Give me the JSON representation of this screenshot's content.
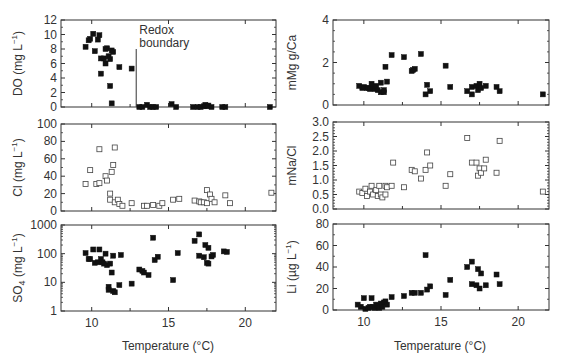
{
  "figure": {
    "x_axis_label": "Temperature (°C)",
    "x_ticks": [
      10,
      15,
      20
    ],
    "annotation": {
      "text_line1": "Redox",
      "text_line2": "boundary",
      "x": 12.9
    }
  },
  "chart_data": [
    {
      "id": "do",
      "type": "scatter",
      "title": "",
      "xlabel": "",
      "ylabel": "DO (mg L⁻¹)",
      "ylabel_main": "DO (mg L",
      "ylabel_sup": "−1",
      "ylabel_end": ")",
      "scale": "linear",
      "xlim": [
        8,
        22
      ],
      "ylim": [
        0,
        12
      ],
      "yticks": [
        0,
        2,
        4,
        6,
        8,
        10,
        12
      ],
      "marker": "filled-square",
      "annotations": [
        {
          "text": "Redox boundary",
          "x": 12.9,
          "type": "vertical-line",
          "y_top": 8
        }
      ],
      "points": [
        [
          9.6,
          8.3
        ],
        [
          9.8,
          9.2
        ],
        [
          9.9,
          9.4
        ],
        [
          10.1,
          10.1
        ],
        [
          10.2,
          7.7
        ],
        [
          10.4,
          9.3
        ],
        [
          10.5,
          9.9
        ],
        [
          10.6,
          6.7
        ],
        [
          10.6,
          4.6
        ],
        [
          10.8,
          6.7
        ],
        [
          10.9,
          6.0
        ],
        [
          10.9,
          8.0
        ],
        [
          11.0,
          8.1
        ],
        [
          11.1,
          7.0
        ],
        [
          11.2,
          6.6
        ],
        [
          11.2,
          2.9
        ],
        [
          11.3,
          7.8
        ],
        [
          11.4,
          7.6
        ],
        [
          11.3,
          0.5
        ],
        [
          11.8,
          5.5
        ],
        [
          12.6,
          5.3
        ],
        [
          13.1,
          0.0
        ],
        [
          13.3,
          0.0
        ],
        [
          13.6,
          0.3
        ],
        [
          13.8,
          0.0
        ],
        [
          14.0,
          0.0
        ],
        [
          14.2,
          0.0
        ],
        [
          15.2,
          0.4
        ],
        [
          15.5,
          0.0
        ],
        [
          16.6,
          0.0
        ],
        [
          16.9,
          0.0
        ],
        [
          17.1,
          0.0
        ],
        [
          17.3,
          0.1
        ],
        [
          17.4,
          0.3
        ],
        [
          17.5,
          0.1
        ],
        [
          17.6,
          0.2
        ],
        [
          17.8,
          0.0
        ],
        [
          18.5,
          0.0
        ],
        [
          18.7,
          0.0
        ],
        [
          21.6,
          0.0
        ]
      ]
    },
    {
      "id": "cl",
      "type": "scatter",
      "ylabel": "Cl (mg L⁻¹)",
      "ylabel_main": "Cl (mg L",
      "ylabel_sup": "−1",
      "ylabel_end": ")",
      "scale": "linear",
      "xlim": [
        8,
        22
      ],
      "ylim": [
        0,
        100
      ],
      "yticks": [
        0,
        20,
        40,
        60,
        80,
        100
      ],
      "marker": "open-square",
      "points": [
        [
          9.6,
          31
        ],
        [
          9.9,
          47
        ],
        [
          10.3,
          31
        ],
        [
          10.5,
          32
        ],
        [
          10.5,
          71
        ],
        [
          10.9,
          40
        ],
        [
          11.0,
          35
        ],
        [
          11.2,
          20
        ],
        [
          11.2,
          13
        ],
        [
          11.3,
          45
        ],
        [
          11.4,
          53
        ],
        [
          11.5,
          73
        ],
        [
          11.5,
          10
        ],
        [
          11.7,
          13
        ],
        [
          11.8,
          8
        ],
        [
          12.0,
          6
        ],
        [
          12.6,
          9
        ],
        [
          13.4,
          6
        ],
        [
          13.6,
          6
        ],
        [
          14.0,
          7
        ],
        [
          14.4,
          6
        ],
        [
          14.6,
          9
        ],
        [
          15.3,
          13
        ],
        [
          15.7,
          14
        ],
        [
          16.7,
          12
        ],
        [
          17.0,
          11
        ],
        [
          17.1,
          10
        ],
        [
          17.3,
          10
        ],
        [
          17.5,
          24
        ],
        [
          17.5,
          9
        ],
        [
          17.7,
          19
        ],
        [
          17.8,
          14
        ],
        [
          18.0,
          10
        ],
        [
          18.7,
          18
        ],
        [
          19.0,
          9
        ],
        [
          21.7,
          21
        ]
      ]
    },
    {
      "id": "so4",
      "type": "scatter",
      "ylabel": "SO₄ (mg L⁻¹)",
      "ylabel_main": "SO",
      "ylabel_sub": "4",
      "ylabel_mid": " (mg L",
      "ylabel_sup": "−1",
      "ylabel_end": ")",
      "scale": "log",
      "xlim": [
        8,
        22
      ],
      "ylim": [
        1,
        1000
      ],
      "yticks": [
        1,
        10,
        100,
        1000
      ],
      "marker": "filled-square",
      "points": [
        [
          9.6,
          105
        ],
        [
          9.8,
          65
        ],
        [
          9.9,
          65
        ],
        [
          10.1,
          140
        ],
        [
          10.2,
          48
        ],
        [
          10.4,
          50
        ],
        [
          10.5,
          140
        ],
        [
          10.6,
          65
        ],
        [
          10.7,
          50
        ],
        [
          10.8,
          45
        ],
        [
          10.9,
          100
        ],
        [
          11.0,
          40
        ],
        [
          11.2,
          45
        ],
        [
          11.3,
          22
        ],
        [
          11.1,
          7
        ],
        [
          11.1,
          5.5
        ],
        [
          11.4,
          5
        ],
        [
          11.5,
          4.5
        ],
        [
          11.4,
          85
        ],
        [
          11.8,
          8
        ],
        [
          11.9,
          90
        ],
        [
          12.6,
          9
        ],
        [
          13.1,
          28
        ],
        [
          13.3,
          25
        ],
        [
          13.4,
          22
        ],
        [
          13.7,
          18
        ],
        [
          14.0,
          360
        ],
        [
          14.1,
          60
        ],
        [
          14.3,
          78
        ],
        [
          15.3,
          12
        ],
        [
          15.6,
          105
        ],
        [
          16.7,
          280
        ],
        [
          17.0,
          470
        ],
        [
          17.0,
          85
        ],
        [
          17.3,
          75
        ],
        [
          17.4,
          200
        ],
        [
          17.5,
          48
        ],
        [
          17.6,
          45
        ],
        [
          17.6,
          160
        ],
        [
          17.8,
          80
        ],
        [
          17.9,
          90
        ],
        [
          18.6,
          120
        ],
        [
          18.8,
          115
        ]
      ]
    },
    {
      "id": "mgca",
      "type": "scatter",
      "ylabel": "mMg g/Ca",
      "scale": "linear",
      "xlim": [
        8,
        22
      ],
      "ylim": [
        0,
        4
      ],
      "yticks": [
        0,
        2,
        4
      ],
      "marker": "filled-square",
      "points": [
        [
          9.7,
          0.9
        ],
        [
          9.9,
          0.8
        ],
        [
          10.0,
          0.85
        ],
        [
          10.2,
          0.8
        ],
        [
          10.3,
          0.8
        ],
        [
          10.4,
          0.75
        ],
        [
          10.5,
          1.0
        ],
        [
          10.6,
          0.8
        ],
        [
          10.7,
          0.75
        ],
        [
          10.8,
          0.9
        ],
        [
          10.9,
          0.7
        ],
        [
          11.1,
          1.05
        ],
        [
          11.1,
          0.6
        ],
        [
          11.3,
          0.7
        ],
        [
          11.3,
          0.6
        ],
        [
          11.4,
          1.8
        ],
        [
          11.5,
          1.1
        ],
        [
          11.8,
          2.35
        ],
        [
          12.6,
          2.25
        ],
        [
          13.1,
          1.6
        ],
        [
          13.2,
          1.65
        ],
        [
          13.3,
          1.7
        ],
        [
          13.7,
          2.4
        ],
        [
          14.0,
          0.5
        ],
        [
          14.1,
          0.95
        ],
        [
          14.3,
          0.65
        ],
        [
          15.3,
          1.85
        ],
        [
          15.6,
          0.85
        ],
        [
          16.7,
          0.65
        ],
        [
          17.0,
          0.85
        ],
        [
          17.0,
          0.5
        ],
        [
          17.3,
          0.9
        ],
        [
          17.4,
          0.7
        ],
        [
          17.5,
          1.0
        ],
        [
          17.6,
          0.8
        ],
        [
          17.9,
          0.9
        ],
        [
          18.6,
          0.85
        ],
        [
          18.8,
          0.65
        ],
        [
          21.6,
          0.5
        ]
      ]
    },
    {
      "id": "nacl",
      "type": "scatter",
      "ylabel": "mNa/Cl",
      "scale": "linear",
      "xlim": [
        8,
        22
      ],
      "ylim": [
        0,
        3
      ],
      "yticks": [
        0.0,
        0.5,
        1.0,
        1.5,
        2.0,
        2.5,
        3.0
      ],
      "ytick_labels": [
        "0.0",
        "0.5",
        "1.0",
        "1.5",
        "2.0",
        "2.5",
        "3.0"
      ],
      "marker": "open-square",
      "points": [
        [
          9.7,
          0.6
        ],
        [
          9.9,
          0.55
        ],
        [
          10.1,
          0.7
        ],
        [
          10.2,
          0.45
        ],
        [
          10.4,
          0.6
        ],
        [
          10.5,
          0.8
        ],
        [
          10.6,
          0.5
        ],
        [
          10.8,
          0.65
        ],
        [
          10.9,
          0.45
        ],
        [
          11.0,
          0.8
        ],
        [
          11.1,
          0.5
        ],
        [
          11.2,
          0.4
        ],
        [
          11.4,
          0.8
        ],
        [
          11.4,
          0.5
        ],
        [
          11.5,
          0.75
        ],
        [
          11.8,
          0.8
        ],
        [
          11.9,
          1.6
        ],
        [
          12.6,
          0.75
        ],
        [
          13.1,
          1.35
        ],
        [
          13.3,
          1.3
        ],
        [
          13.7,
          1.05
        ],
        [
          14.0,
          1.35
        ],
        [
          14.1,
          1.95
        ],
        [
          14.3,
          1.5
        ],
        [
          15.3,
          0.8
        ],
        [
          15.6,
          1.2
        ],
        [
          16.7,
          2.45
        ],
        [
          17.0,
          1.6
        ],
        [
          17.3,
          1.6
        ],
        [
          17.4,
          1.15
        ],
        [
          17.5,
          1.4
        ],
        [
          17.6,
          1.25
        ],
        [
          17.8,
          1.4
        ],
        [
          17.9,
          1.7
        ],
        [
          18.6,
          1.25
        ],
        [
          18.8,
          2.35
        ],
        [
          21.6,
          0.6
        ]
      ]
    },
    {
      "id": "li",
      "type": "scatter",
      "ylabel": "Li (µg L⁻¹)",
      "ylabel_main": "Li (µg L",
      "ylabel_sup": "−1",
      "ylabel_end": ")",
      "scale": "linear",
      "xlim": [
        8,
        22
      ],
      "ylim": [
        0,
        80
      ],
      "yticks": [
        0,
        20,
        40,
        60,
        80
      ],
      "marker": "filled-square",
      "points": [
        [
          9.6,
          5
        ],
        [
          9.8,
          3
        ],
        [
          10.0,
          11
        ],
        [
          10.1,
          1
        ],
        [
          10.3,
          2
        ],
        [
          10.4,
          3
        ],
        [
          10.5,
          11
        ],
        [
          10.6,
          3
        ],
        [
          10.7,
          2
        ],
        [
          10.8,
          5
        ],
        [
          10.9,
          4
        ],
        [
          11.0,
          2
        ],
        [
          11.1,
          6
        ],
        [
          11.2,
          3
        ],
        [
          11.3,
          7
        ],
        [
          11.4,
          8
        ],
        [
          11.5,
          5
        ],
        [
          11.8,
          12
        ],
        [
          12.6,
          13
        ],
        [
          13.1,
          16
        ],
        [
          13.3,
          16
        ],
        [
          13.7,
          16
        ],
        [
          14.0,
          51
        ],
        [
          14.1,
          19
        ],
        [
          14.3,
          22
        ],
        [
          15.3,
          14
        ],
        [
          15.6,
          28
        ],
        [
          16.7,
          40
        ],
        [
          17.0,
          45
        ],
        [
          17.0,
          24
        ],
        [
          17.3,
          23
        ],
        [
          17.4,
          38
        ],
        [
          17.5,
          20
        ],
        [
          17.6,
          34
        ],
        [
          17.9,
          23
        ],
        [
          18.6,
          33
        ],
        [
          18.8,
          24
        ]
      ]
    }
  ]
}
